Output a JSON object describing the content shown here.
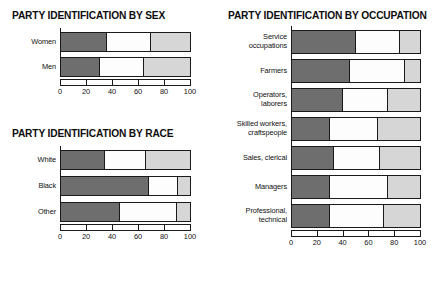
{
  "figure": {
    "segment_labels": [
      "Democrat",
      "Independent",
      "Republican"
    ],
    "segment_colors": [
      "#6e6e6e",
      "#fdfdfd",
      "#d6d6d6"
    ],
    "axis_ticks": [
      0,
      20,
      40,
      60,
      80,
      100
    ]
  },
  "chart_data": [
    {
      "type": "bar",
      "orientation": "horizontal",
      "stacked": true,
      "title": "PARTY IDENTIFICATION BY SEX",
      "xlabel": "",
      "ylabel": "",
      "xlim": [
        0,
        100
      ],
      "grid": false,
      "legend": "none",
      "ticks": [
        0,
        20,
        40,
        60,
        80,
        100
      ],
      "categories": [
        "Women",
        "Men"
      ],
      "series": [
        {
          "name": "Democrat",
          "values": [
            36,
            30
          ]
        },
        {
          "name": "Independent",
          "values": [
            34,
            34
          ]
        },
        {
          "name": "Republican",
          "values": [
            30,
            36
          ]
        }
      ]
    },
    {
      "type": "bar",
      "orientation": "horizontal",
      "stacked": true,
      "title": "PARTY IDENTIFICATION BY RACE",
      "xlabel": "",
      "ylabel": "",
      "xlim": [
        0,
        100
      ],
      "grid": false,
      "legend": "none",
      "ticks": [
        0,
        20,
        40,
        60,
        80,
        100
      ],
      "categories": [
        "White",
        "Black",
        "Other"
      ],
      "series": [
        {
          "name": "Democrat",
          "values": [
            34,
            68,
            46
          ]
        },
        {
          "name": "Independent",
          "values": [
            32,
            23,
            44
          ]
        },
        {
          "name": "Republican",
          "values": [
            34,
            9,
            10
          ]
        }
      ]
    },
    {
      "type": "bar",
      "orientation": "horizontal",
      "stacked": true,
      "title": "PARTY IDENTIFICATION BY OCCUPATION",
      "xlabel": "",
      "ylabel": "",
      "xlim": [
        0,
        100
      ],
      "grid": false,
      "legend": "none",
      "ticks": [
        0,
        20,
        40,
        60,
        80,
        100
      ],
      "categories": [
        "Service\noccupations",
        "Farmers",
        "Operators,\nlaborers",
        "Skilled workers,\ncraftspeople",
        "Sales, clerical",
        "Managers",
        "Professional,\ntechnical"
      ],
      "series": [
        {
          "name": "Democrat",
          "values": [
            50,
            45,
            40,
            30,
            33,
            30,
            30
          ]
        },
        {
          "name": "Independent",
          "values": [
            34,
            43,
            35,
            37,
            36,
            45,
            42
          ]
        },
        {
          "name": "Republican",
          "values": [
            16,
            12,
            25,
            33,
            31,
            25,
            28
          ]
        }
      ]
    }
  ]
}
